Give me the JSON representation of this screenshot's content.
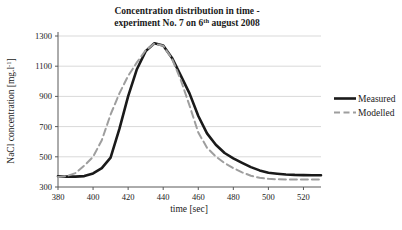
{
  "chart_data": {
    "type": "line",
    "title_line1": "Concentration distribution in time -",
    "title_line2_pre": "experiment No. 7 on 6",
    "title_line2_sup": "th",
    "title_line2_post": " august 2008",
    "xlabel": "time [sec]",
    "ylabel_pre": "NaCl concentration [mg.l",
    "ylabel_sup": "-1",
    "ylabel_post": "]",
    "xlim": [
      380,
      530
    ],
    "ylim": [
      300,
      1300
    ],
    "x_ticks": [
      380,
      400,
      420,
      440,
      460,
      480,
      500,
      520
    ],
    "y_ticks": [
      300,
      500,
      700,
      900,
      1100,
      1300
    ],
    "grid": "horizontal",
    "legend_position": "right",
    "colors": {
      "measured": "#1a1a1a",
      "modelled": "#9e9e9e",
      "gridline": "#d9d9d9",
      "axis": "#595959",
      "text": "#1a1a1a",
      "background": "#ffffff"
    },
    "x": [
      380,
      385,
      390,
      395,
      400,
      405,
      410,
      415,
      420,
      425,
      430,
      435,
      440,
      445,
      450,
      455,
      460,
      465,
      470,
      475,
      480,
      485,
      490,
      495,
      500,
      505,
      510,
      515,
      520,
      525,
      530
    ],
    "series": [
      {
        "name": "Measured",
        "style": "solid",
        "color": "#1a1a1a",
        "values": [
          370,
          369,
          369,
          372,
          390,
          425,
          495,
          685,
          900,
          1080,
          1200,
          1252,
          1238,
          1155,
          1040,
          920,
          770,
          655,
          580,
          525,
          490,
          460,
          432,
          410,
          395,
          388,
          383,
          380,
          379,
          378,
          378
        ]
      },
      {
        "name": "Modelled",
        "style": "dashed",
        "color": "#9e9e9e",
        "values": [
          366,
          372,
          392,
          442,
          500,
          610,
          780,
          920,
          1035,
          1125,
          1205,
          1250,
          1235,
          1150,
          1010,
          840,
          660,
          560,
          502,
          458,
          425,
          397,
          375,
          361,
          354,
          351,
          350,
          350,
          350,
          350,
          350
        ]
      }
    ]
  }
}
